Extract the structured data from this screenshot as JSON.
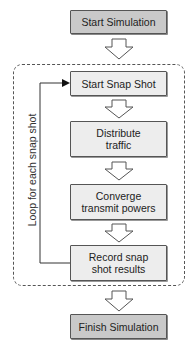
{
  "diagram": {
    "start": "Start Simulation",
    "loop": {
      "label": "Loop for each snap shot",
      "steps": [
        "Start Snap Shot",
        "Distribute\ntraffic",
        "Converge\ntransmit powers",
        "Record snap\nshot results"
      ]
    },
    "finish": "Finish Simulation"
  },
  "colors": {
    "terminal_fill": "#c9c9c9",
    "step_fill": "#ededed",
    "border": "#555555"
  }
}
